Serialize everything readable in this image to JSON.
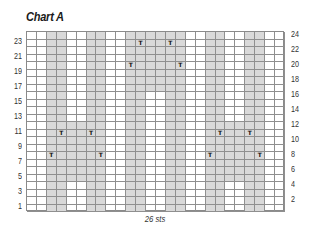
{
  "title": "Chart A",
  "footer_label": "26 sts",
  "grid": {
    "columns": 26,
    "rows": 24,
    "colors": {
      "shaded": "#d9d9d9",
      "unshaded": "#ffffff",
      "line": "#8f8f8f",
      "symbol": "#111111"
    },
    "symbol_glyph": "T",
    "shaded_regions": [
      {
        "cols": [
          3,
          4
        ],
        "rows": [
          1,
          24
        ]
      },
      {
        "cols": [
          7,
          8
        ],
        "rows": [
          1,
          24
        ]
      },
      {
        "cols": [
          5,
          6
        ],
        "rows": [
          5,
          12
        ]
      },
      {
        "cols": [
          11,
          12
        ],
        "rows": [
          1,
          24
        ]
      },
      {
        "cols": [
          15,
          16
        ],
        "rows": [
          1,
          24
        ]
      },
      {
        "cols": [
          13,
          14
        ],
        "rows": [
          17,
          24
        ]
      },
      {
        "cols": [
          19,
          20
        ],
        "rows": [
          1,
          24
        ]
      },
      {
        "cols": [
          23,
          24
        ],
        "rows": [
          1,
          24
        ]
      },
      {
        "cols": [
          21,
          22
        ],
        "rows": [
          5,
          12
        ]
      }
    ],
    "symbols": [
      {
        "col": 4,
        "row": 11
      },
      {
        "col": 7,
        "row": 11
      },
      {
        "col": 3,
        "row": 8
      },
      {
        "col": 8,
        "row": 8
      },
      {
        "col": 12,
        "row": 23
      },
      {
        "col": 15,
        "row": 23
      },
      {
        "col": 11,
        "row": 20
      },
      {
        "col": 16,
        "row": 20
      },
      {
        "col": 20,
        "row": 11
      },
      {
        "col": 23,
        "row": 11
      },
      {
        "col": 19,
        "row": 8
      },
      {
        "col": 24,
        "row": 8
      }
    ]
  },
  "left_row_labels": [
    "23",
    "21",
    "19",
    "17",
    "15",
    "13",
    "11",
    "9",
    "7",
    "5",
    "3",
    "1"
  ],
  "right_row_labels": [
    "24",
    "22",
    "20",
    "18",
    "16",
    "14",
    "12",
    "10",
    "8",
    "6",
    "4",
    "2"
  ]
}
